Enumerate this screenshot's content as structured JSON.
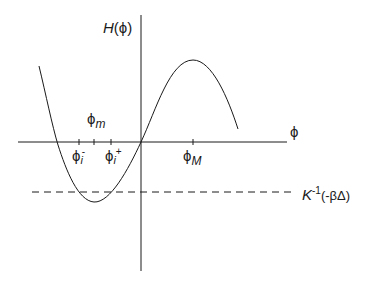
{
  "figure": {
    "y_axis_label": {
      "main": "H",
      "arg": "(ϕ)"
    },
    "x_axis_label": "ϕ",
    "points": {
      "phi_m": {
        "base": "ϕ",
        "sub": "m"
      },
      "phi_i_minus": {
        "base": "ϕ",
        "sub": "i",
        "sup": "-"
      },
      "phi_i_plus": {
        "base": "ϕ",
        "sub": "i",
        "sup": "+"
      },
      "phi_M": {
        "base": "ϕ",
        "sub": "M"
      }
    },
    "threshold_label": {
      "main": "K",
      "sup": "-1",
      "arg": "(-βΔ)"
    },
    "colors": {
      "ink": "#1a1a1a",
      "background": "#ffffff"
    }
  }
}
